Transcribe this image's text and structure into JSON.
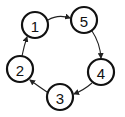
{
  "diagram": {
    "type": "directed-cycle",
    "nodes": [
      {
        "id": "1",
        "label": "1",
        "cx": 35,
        "cy": 25
      },
      {
        "id": "5",
        "label": "5",
        "cx": 84,
        "cy": 20
      },
      {
        "id": "4",
        "label": "4",
        "cx": 101,
        "cy": 72
      },
      {
        "id": "3",
        "label": "3",
        "cx": 60,
        "cy": 97
      },
      {
        "id": "2",
        "label": "2",
        "cx": 20,
        "cy": 69
      }
    ],
    "edges": [
      {
        "from": "1",
        "to": "5"
      },
      {
        "from": "5",
        "to": "4"
      },
      {
        "from": "4",
        "to": "3"
      },
      {
        "from": "3",
        "to": "2"
      },
      {
        "from": "2",
        "to": "1"
      }
    ],
    "colors": {
      "stroke": "#111111",
      "fill": "#ffffff",
      "background": "#ffffff"
    }
  }
}
